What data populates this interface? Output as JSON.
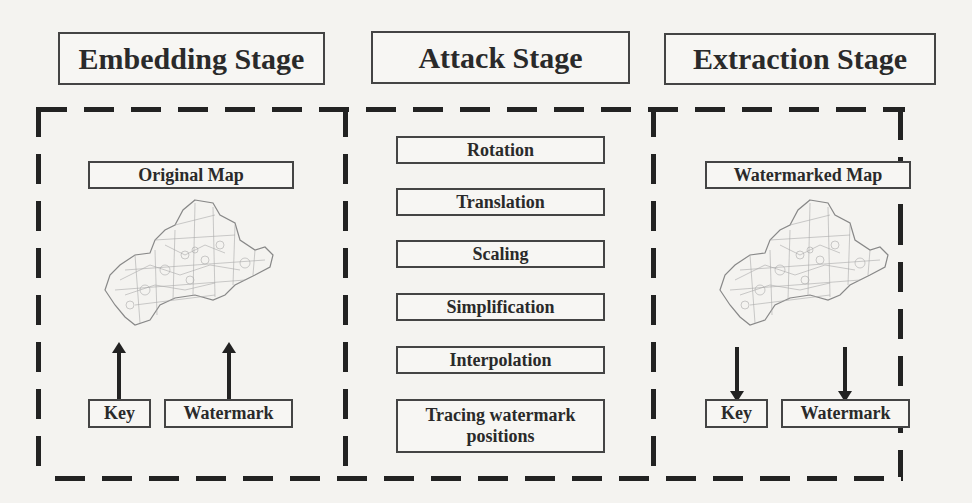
{
  "stages": {
    "embedding": {
      "title": "Embedding Stage",
      "input_map": "Original Map",
      "key": "Key",
      "watermark": "Watermark",
      "arrow_direction": "up"
    },
    "attack": {
      "title": "Attack Stage",
      "operations": [
        "Rotation",
        "Translation",
        "Scaling",
        "Simplification",
        "Interpolation",
        "Tracing watermark positions"
      ]
    },
    "extraction": {
      "title": "Extraction Stage",
      "input_map": "Watermarked Map",
      "key": "Key",
      "watermark": "Watermark",
      "arrow_direction": "down"
    }
  },
  "colors": {
    "line": "#222222",
    "box_border": "#444444",
    "background": "#f4f3f0"
  }
}
